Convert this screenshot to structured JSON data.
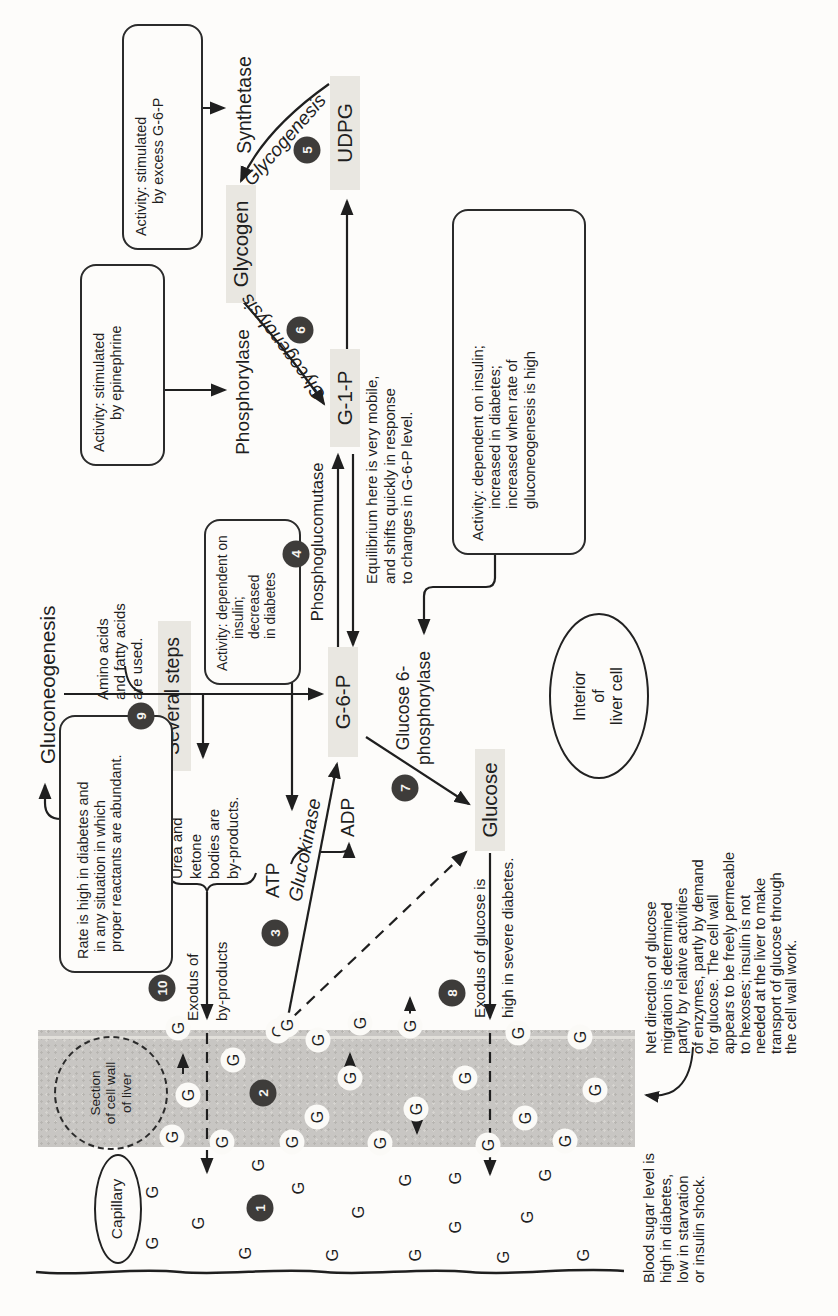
{
  "markers": {
    "g": "G"
  },
  "steps": [
    "1",
    "2",
    "3",
    "4",
    "5",
    "6",
    "7",
    "8",
    "9",
    "10"
  ],
  "regions": {
    "capillary": "Capillary",
    "section": [
      "Section",
      "of cell wall",
      "of liver"
    ],
    "interior": [
      "Interior",
      "of",
      "liver cell"
    ]
  },
  "metabolites": {
    "udpg": "UDPG",
    "glycogen": "Glycogen",
    "g1p": "G-1-P",
    "g6p": "G-6-P",
    "glucose": "Glucose",
    "several_steps": "Several steps"
  },
  "enzymes": {
    "synthetase": "Synthetase",
    "phosphorylase": "Phosphorylase",
    "phosphoglucomutase": "Phosphoglucomutase",
    "glucose6phosphorylase": [
      "Glucose 6-",
      "phosphorylase"
    ],
    "glucokinase": "Glucokinase",
    "atp": "ATP",
    "adp": "ADP"
  },
  "pathways": {
    "gluconeogenesis": "Gluconeogenesis",
    "glycogenesis": "Glycogenesis",
    "glycogenolysis": "Glycogenolysis"
  },
  "annotations": {
    "amino": [
      "Amino acids",
      "and fatty acids",
      "are used."
    ],
    "equilibrium": [
      "Equilibrium here is very mobile,",
      "and shifts quickly in response",
      "to changes in G-6-P level."
    ],
    "urea": [
      "Urea and",
      "ketone",
      "bodies are",
      "by-products."
    ],
    "exodus_byproducts": [
      "Exodus of",
      "by-products"
    ],
    "exodus_glucose": [
      "Exodus of glucose is",
      "high in severe diabetes."
    ],
    "blood_sugar": [
      "Blood sugar level is",
      "high in diabetes,",
      "low in starvation",
      "or insulin shock."
    ],
    "net_direction": [
      "Net direction of glucose",
      "migration is determined",
      "partly by relative activities",
      "of enzymes, partly by demand",
      "for glucose. The cell wall",
      "appears to be freely permeable",
      "to hexoses; insulin is not",
      "needed at the liver to make",
      "transport of glucose through",
      "the cell wall work."
    ]
  },
  "callouts": {
    "synthetase_box": [
      "Activity: stimulated",
      "by excess G-6-P"
    ],
    "phosphorylase_box": [
      "Activity: stimulated",
      "by epinephrine"
    ],
    "glucokinase_box": [
      "Activity: dependent on",
      "insulin; decreased",
      "in diabetes"
    ],
    "phosphatase_box": [
      "Activity: dependent on insulin;",
      "increased in diabetes;",
      "increased when rate of",
      "gluconeogenesis is high"
    ],
    "gluconeogenesis_box": [
      "Rate is high in diabetes and",
      "in any situation in which",
      "proper reactants are abundant."
    ]
  },
  "colors": {
    "band": "#c8c6c3",
    "step_circle": "#3e3c3a",
    "highlight": "#e9e7e1",
    "ink": "#1f1f1f"
  }
}
